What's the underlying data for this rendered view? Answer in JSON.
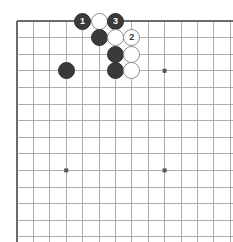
{
  "diagram": {
    "kind": "go-board-diagram",
    "title": "",
    "board": {
      "background_color": "#ffffff",
      "line_color": "#9a9a9a",
      "edge_color": "#6b6b6b",
      "origin_x": 17,
      "origin_y": 21,
      "spacing_x": 16.4,
      "spacing_y": 16.6,
      "cols": 14,
      "rows": 14,
      "top_edge_visible": true,
      "left_edge_visible": true,
      "right_edge_visible": false,
      "bottom_edge_visible": false,
      "star_points": [
        {
          "col": 3,
          "row": 3
        },
        {
          "col": 9,
          "row": 3
        },
        {
          "col": 3,
          "row": 9
        },
        {
          "col": 9,
          "row": 9
        }
      ],
      "star_point_color": "#555555"
    },
    "stones": [
      {
        "name": "black-stone-move-1",
        "color": "black",
        "col": 4,
        "row": 0,
        "label": "1"
      },
      {
        "name": "white-stone-a",
        "color": "white",
        "col": 5,
        "row": 0,
        "label": ""
      },
      {
        "name": "black-stone-move-3",
        "color": "black",
        "col": 6,
        "row": 0,
        "label": "3"
      },
      {
        "name": "black-stone-b",
        "color": "black",
        "col": 5,
        "row": 1,
        "label": ""
      },
      {
        "name": "white-stone-c",
        "color": "white",
        "col": 6,
        "row": 1,
        "label": ""
      },
      {
        "name": "white-stone-move-2",
        "color": "white",
        "col": 7,
        "row": 1,
        "label": "2"
      },
      {
        "name": "black-stone-d",
        "color": "black",
        "col": 6,
        "row": 2,
        "label": ""
      },
      {
        "name": "white-stone-e",
        "color": "white",
        "col": 7,
        "row": 2,
        "label": ""
      },
      {
        "name": "black-stone-f",
        "color": "black",
        "col": 6,
        "row": 3,
        "label": ""
      },
      {
        "name": "white-stone-g",
        "color": "white",
        "col": 7,
        "row": 3,
        "label": ""
      },
      {
        "name": "black-stone-corner",
        "color": "black",
        "col": 3,
        "row": 3,
        "label": ""
      }
    ],
    "stone_diameter": 17,
    "colors": {
      "black_stone": "#3a3a3a",
      "white_stone": "#ffffff",
      "white_stone_border": "#8d8d8d",
      "black_label": "#ffffff",
      "white_label": "#333333"
    }
  }
}
